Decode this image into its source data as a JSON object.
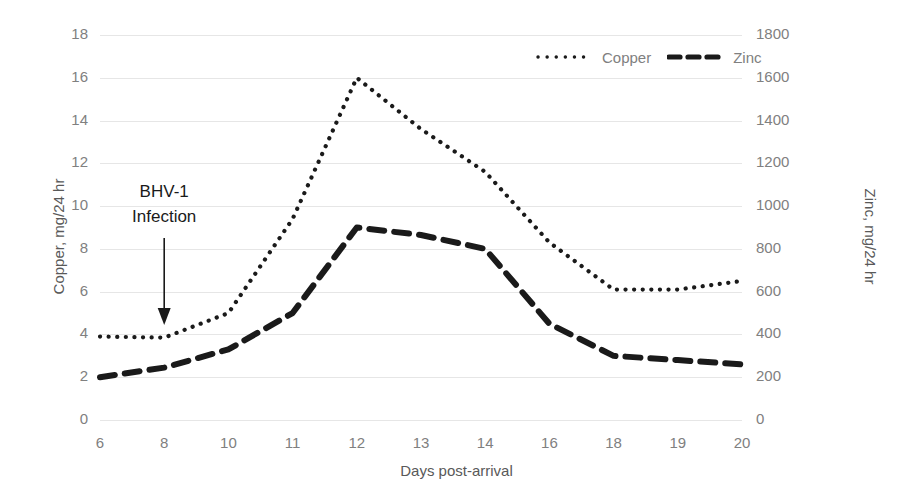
{
  "chart_data": {
    "type": "line",
    "title": "",
    "xlabel": "Days post-arrival",
    "categories": [
      "6",
      "8",
      "10",
      "11",
      "12",
      "13",
      "14",
      "16",
      "18",
      "19",
      "20"
    ],
    "grid": true,
    "legend_position": "top-right",
    "axes": {
      "left": {
        "label": "Copper, mg/24 hr",
        "ticks": [
          "18",
          "16",
          "14",
          "12",
          "10",
          "8",
          "6",
          "4",
          "2",
          "0"
        ],
        "tick_values": [
          18,
          16,
          14,
          12,
          10,
          8,
          6,
          4,
          2,
          0
        ],
        "min": 0,
        "max": 18
      },
      "right": {
        "label": "Zinc, mg/24 hr",
        "ticks": [
          "1800",
          "1600",
          "1400",
          "1200",
          "1000",
          "800",
          "600",
          "400",
          "200",
          "0"
        ],
        "tick_values": [
          1800,
          1600,
          1400,
          1200,
          1000,
          800,
          600,
          400,
          200,
          0
        ],
        "min": 0,
        "max": 1800
      }
    },
    "series": [
      {
        "name": "Copper",
        "axis": "left",
        "style": "dotted",
        "color": "#1a1a1a",
        "values": [
          3.9,
          3.85,
          5.0,
          9.4,
          16.0,
          13.6,
          11.6,
          8.3,
          6.1,
          6.1,
          6.5
        ]
      },
      {
        "name": "Zinc",
        "axis": "right",
        "style": "dashed",
        "color": "#1a1a1a",
        "values": [
          200,
          245,
          330,
          500,
          900,
          865,
          800,
          450,
          300,
          280,
          260
        ]
      }
    ],
    "annotations": [
      {
        "name": "bhv-1-infection",
        "line1": "BHV-1",
        "line2": "Infection",
        "arrow_at_category": "8",
        "arrow": true
      }
    ]
  },
  "legend": {
    "items": [
      {
        "label": "Copper",
        "marker": "dotted-line-icon"
      },
      {
        "label": "Zinc",
        "marker": "dashed-line-icon"
      }
    ]
  }
}
